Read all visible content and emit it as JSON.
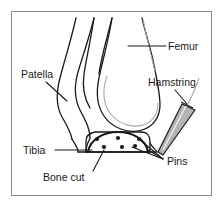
{
  "figure": {
    "border_color": "#8a8a8a",
    "background_color": "#ffffff",
    "line_color": "#1a1a1a",
    "soft_line_color": "#a9a9a9",
    "graft_fill_color": "#b3b3b3",
    "text_color": "#1a1a1a"
  },
  "labels": {
    "femur": "Femur",
    "patella": "Patella",
    "hamstring": "Hamstring",
    "tibia": "Tibia",
    "bone_cut": "Bone cut",
    "pins": "Pins"
  },
  "structures": {
    "pin_count": 6,
    "pin_rows": [
      {
        "name": "upper-row",
        "count": 3
      },
      {
        "name": "lower-arc-row",
        "count": 3
      }
    ]
  }
}
